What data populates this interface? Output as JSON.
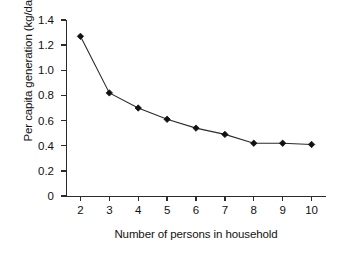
{
  "chart_data": {
    "type": "line",
    "title": "",
    "xlabel": "Number of persons in household",
    "ylabel": "Per capita generation (kg/day)",
    "x": [
      2,
      3,
      4,
      5,
      6,
      7,
      8,
      9,
      10
    ],
    "values": [
      1.27,
      0.82,
      0.7,
      0.61,
      0.54,
      0.49,
      0.42,
      0.42,
      0.41
    ],
    "series": [
      {
        "name": "Per capita generation",
        "values": [
          1.27,
          0.82,
          0.7,
          0.61,
          0.54,
          0.49,
          0.42,
          0.42,
          0.41
        ]
      }
    ],
    "xlim": [
      1.5,
      10.5
    ],
    "ylim": [
      0,
      1.4
    ],
    "xticks": [
      2,
      3,
      4,
      5,
      6,
      7,
      8,
      9,
      10
    ],
    "xtick_labels": [
      "2",
      "3",
      "4",
      "5",
      "6",
      "7",
      "8",
      "9",
      "10"
    ],
    "yticks": [
      0,
      0.2,
      0.4,
      0.6,
      0.8,
      1.0,
      1.2,
      1.4
    ],
    "ytick_labels": [
      "0",
      "0.2",
      "0.4",
      "0.6",
      "0.8",
      "1.0",
      "1.2",
      "1.4"
    ],
    "grid": false,
    "legend": null,
    "marker": "diamond",
    "line_color": "#2b2b2b",
    "marker_color": "#111111",
    "axis_color": "#2b2b2b",
    "background_color": "#ffffff"
  }
}
